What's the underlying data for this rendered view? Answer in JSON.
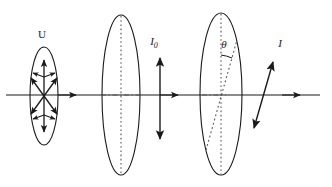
{
  "figure": {
    "width": 332,
    "height": 187,
    "background_color": "#ffffff",
    "stroke_color": "#1a1a1a",
    "dotted_color": "#555555"
  },
  "labels": {
    "unpolarized": "U",
    "intensity_initial": "I",
    "intensity_initial_subscript": "0",
    "angle": "θ",
    "intensity_final": "I"
  },
  "optical_axis": {
    "name": "optical-axis",
    "y": 95,
    "x_start": 6,
    "x_end": 320,
    "propagation_arrow_x_positions": [
      74,
      176,
      298
    ]
  },
  "elements": [
    {
      "id": "unpolarized-source",
      "kind": "ellipse",
      "label": "U",
      "cx": 44,
      "cy": 96,
      "rx": 14,
      "ry": 49,
      "description": "unpolarized light shown as star of double-headed arrows"
    },
    {
      "id": "polarizer",
      "kind": "ellipse",
      "label": "",
      "cx": 121,
      "cy": 95,
      "rx": 19,
      "ry": 80,
      "description": "polarizer with vertical dotted transmission axis"
    },
    {
      "id": "analyzer",
      "kind": "ellipse",
      "label": "",
      "cx": 221,
      "cy": 94,
      "rx": 21,
      "ry": 81,
      "description": "analyzer with tilted dotted transmission axis at angle theta from vertical"
    }
  ],
  "vectors": [
    {
      "id": "polarized-vector-I0",
      "label": "I",
      "subscript": "0",
      "orientation": "vertical",
      "x": 160,
      "y_top": 56,
      "y_bottom": 140,
      "label_x": 157,
      "label_y": 42
    },
    {
      "id": "polarized-vector-I",
      "label": "I",
      "subscript": "",
      "orientation": "tilted",
      "x_top": 273,
      "y_top": 61,
      "x_bottom": 254,
      "y_bottom": 128,
      "label_x": 278,
      "label_y": 46
    }
  ],
  "angle_marker": {
    "id": "theta-angle",
    "symbol": "θ",
    "label_x": 224,
    "label_y": 46,
    "vertex_x": 221,
    "vertex_y": 95,
    "from": "vertical dotted axis",
    "to": "tilted dotted axis"
  }
}
